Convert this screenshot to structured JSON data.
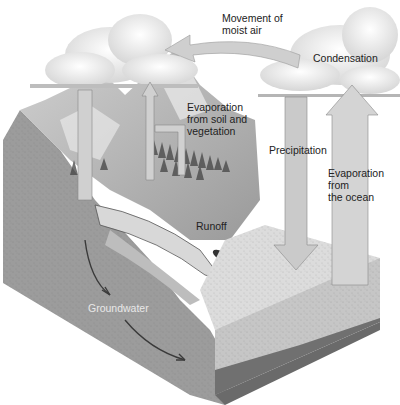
{
  "labels": {
    "movement": "Movement of\nmoist air",
    "condensation": "Condensation",
    "evap_soil": "Evaporation\nfrom soil and\nvegetation",
    "precipitation": "Precipitation",
    "evap_ocean": "Evaporation\nfrom\nthe ocean",
    "runoff": "Runoff",
    "groundwater": "Groundwater"
  },
  "colors": {
    "land_side": "#9a9a9a",
    "ocean_side": "#c4c4c4",
    "ocean_bottom": "#6e6e6e",
    "ocean_top": "#d8d8d8",
    "arrow": "#c8c8c8",
    "cloud": "#f4f4f4",
    "text": "#222222",
    "groundwater_text": "#e8e8e8"
  }
}
